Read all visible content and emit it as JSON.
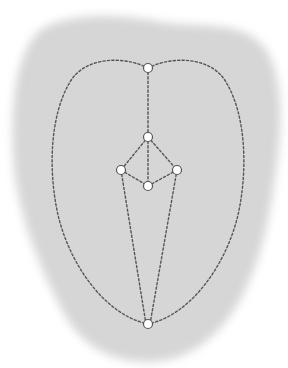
{
  "canvas": {
    "width": 288,
    "height": 368,
    "background": "#ffffff"
  },
  "colors": {
    "blob_fill": "#d2d2d2",
    "edge_stroke": "#555555",
    "node_fill": "#ffffff",
    "node_stroke": "#555555"
  },
  "diagram": {
    "type": "node-graph",
    "edge_style": "dotted",
    "nodes": [
      {
        "id": "top",
        "x": 148,
        "y": 68
      },
      {
        "id": "upper-mid",
        "x": 148,
        "y": 137
      },
      {
        "id": "left",
        "x": 121,
        "y": 170
      },
      {
        "id": "right",
        "x": 177,
        "y": 170
      },
      {
        "id": "center",
        "x": 148,
        "y": 186
      },
      {
        "id": "bottom",
        "x": 148,
        "y": 324
      }
    ],
    "edges": [
      {
        "from": "top",
        "to": "upper-mid",
        "shape": "straight"
      },
      {
        "from": "upper-mid",
        "to": "left",
        "shape": "straight"
      },
      {
        "from": "upper-mid",
        "to": "right",
        "shape": "straight"
      },
      {
        "from": "upper-mid",
        "to": "center",
        "shape": "straight"
      },
      {
        "from": "left",
        "to": "center",
        "shape": "straight"
      },
      {
        "from": "right",
        "to": "center",
        "shape": "straight"
      },
      {
        "from": "left",
        "to": "bottom",
        "shape": "straight"
      },
      {
        "from": "right",
        "to": "bottom",
        "shape": "straight"
      },
      {
        "from": "top",
        "to": "bottom",
        "shape": "curve-left"
      },
      {
        "from": "top",
        "to": "bottom",
        "shape": "curve-right"
      }
    ]
  }
}
